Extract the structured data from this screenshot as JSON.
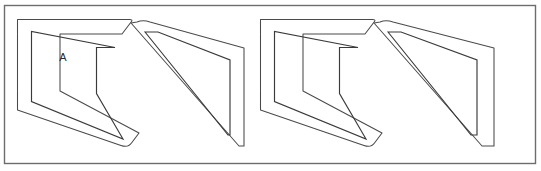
{
  "figure": {
    "width": 541,
    "height": 171,
    "background_color": "#ffffff",
    "line_color": "#3a3a3a",
    "frame_color": "#6d6d6d"
  },
  "frame": {
    "name": "outer-border",
    "x": 4.5,
    "y": 5.5,
    "width": 531,
    "height": 158
  },
  "labels": [
    {
      "text": "A",
      "x": 63,
      "y": 58,
      "belongs_to": "shape-1"
    }
  ],
  "shapes": [
    {
      "id": "shape-1",
      "orientation": "upright",
      "label": "A",
      "outer_path": "M 17.5,19.5 L 17.5,110 L 121,145.5 Q 128,148 131.5,143 L 139,133 L 60,91 L 60,34 L 122,34 L 131.5,21.5 Q 133,19.5 129.5,19.5 Z",
      "inner_path": "M 31.5,31.5 L 31.5,101.5 L 123,139 L 96.5,93.5 L 96.5,47.5 L 115,47.5 Z",
      "outer_points": "17.5,19.5 129.5,19.5 139,133 131.5,143 17.5,110",
      "inner_points": "31.5,31.5 96.5,31.5 96.5,101.5 31.5,101.5"
    },
    {
      "id": "shape-2",
      "orientation": "flipped",
      "label": "",
      "outer_path": "M 131,23 L 239,146 L 244,146 L 244,48 L 150,22 Q 143,19.5 137,22 Z",
      "inner_path": "M 145,32 L 228,135 L 230,135 L 230,60 L 158,32 Z",
      "outer_points": "131,23 150,22 244,48 244,146 239,146",
      "inner_points": "145,32 158,32 230,60 230,135 228,135"
    },
    {
      "id": "shape-3",
      "orientation": "upright",
      "label": "",
      "outer_path": "M 260.5,19.5 L 260.5,110 L 364,145.5 Q 371,148 374.5,143 L 382,133 L 303,91 L 303,34 L 365,34 L 374.5,21.5 Q 376,19.5 372.5,19.5 Z",
      "inner_path": "M 274.5,31.5 L 274.5,101.5 L 366,139 L 339.5,93.5 L 339.5,47.5 L 358,47.5 Z",
      "outer_points": "260.5,19.5 372.5,19.5 382,133 374.5,143 260.5,110",
      "inner_points": "274.5,31.5 339.5,31.5 339.5,101.5 274.5,101.5"
    },
    {
      "id": "shape-4",
      "orientation": "flipped",
      "label": "",
      "outer_path": "M 374,23 L 482,146 L 494,146 L 494,48 L 393,22 Q 386,19.5 380,22 Z",
      "inner_path": "M 388,32 L 471,135 L 477,135 L 477,60 L 401,32 Z",
      "outer_points": "374,23 393,22 494,48 494,146 482,146",
      "inner_points": "388,32 401,32 477,60 477,135 471,135"
    }
  ]
}
